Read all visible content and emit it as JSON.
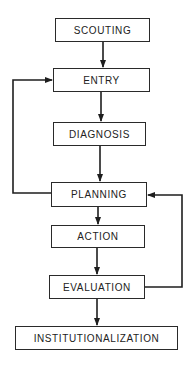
{
  "diagram": {
    "type": "flowchart",
    "line_color": "#1e1e1e",
    "nodes": [
      {
        "id": "scouting",
        "label": "SCOUTING"
      },
      {
        "id": "entry",
        "label": "ENTRY"
      },
      {
        "id": "diagnosis",
        "label": "DIAGNOSIS"
      },
      {
        "id": "planning",
        "label": "PLANNING"
      },
      {
        "id": "action",
        "label": "ACTION"
      },
      {
        "id": "evaluation",
        "label": "EVALUATION"
      },
      {
        "id": "institutionalization",
        "label": "INSTITUTIONALIZATION"
      }
    ],
    "edges": [
      {
        "from": "scouting",
        "to": "entry"
      },
      {
        "from": "entry",
        "to": "diagnosis"
      },
      {
        "from": "diagnosis",
        "to": "planning"
      },
      {
        "from": "planning",
        "to": "action"
      },
      {
        "from": "action",
        "to": "evaluation"
      },
      {
        "from": "evaluation",
        "to": "institutionalization"
      },
      {
        "from": "planning",
        "to": "entry",
        "type": "feedback-left"
      },
      {
        "from": "evaluation",
        "to": "planning",
        "type": "feedback-right"
      }
    ]
  }
}
